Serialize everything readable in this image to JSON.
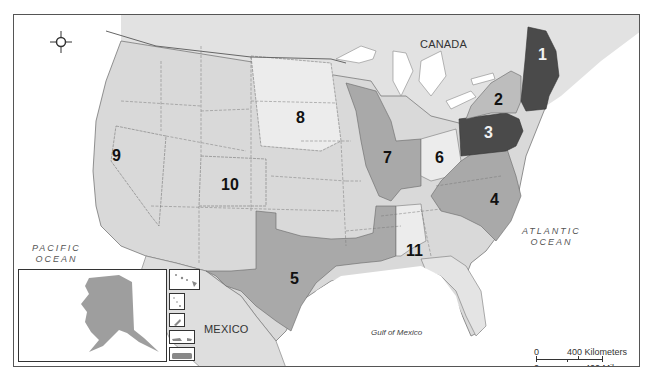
{
  "map": {
    "title": "United States regions map",
    "countries": [
      {
        "name": "CANADA"
      },
      {
        "name": "MEXICO"
      }
    ],
    "water_bodies": [
      {
        "name": "PACIFIC OCEAN",
        "line1": "PACIFIC",
        "line2": "OCEAN"
      },
      {
        "name": "ATLANTIC OCEAN",
        "line1": "ATLANTIC",
        "line2": "OCEAN"
      },
      {
        "name": "Gulf of Mexico"
      }
    ],
    "regions": [
      {
        "id": "1",
        "label": "1",
        "shade": "#4a4a4a",
        "states": "Maine, New Hampshire, Massachusetts"
      },
      {
        "id": "2",
        "label": "2",
        "shade": "#bdbdbd",
        "states": "New York, Vermont, Connecticut, Rhode Island"
      },
      {
        "id": "3",
        "label": "3",
        "shade": "#4a4a4a",
        "states": "Pennsylvania, New Jersey"
      },
      {
        "id": "4",
        "label": "4",
        "shade": "#a9a9a9",
        "states": "Virginia, West Virginia, North Carolina, South Carolina, Maryland, Delaware"
      },
      {
        "id": "5",
        "label": "5",
        "shade": "#a9a9a9",
        "states": "Texas, Louisiana, Mississippi, Oklahoma panhandle area"
      },
      {
        "id": "6",
        "label": "6",
        "shade": "#ececec",
        "states": "Ohio"
      },
      {
        "id": "7",
        "label": "7",
        "shade": "#a9a9a9",
        "states": "Wisconsin, Illinois, Indiana"
      },
      {
        "id": "8",
        "label": "8",
        "shade": "#ececec",
        "states": "North Dakota, South Dakota, Nebraska"
      },
      {
        "id": "9",
        "label": "9",
        "shade": "#d9d9d9",
        "states": "Nevada"
      },
      {
        "id": "10",
        "label": "10",
        "shade": "#d9d9d9",
        "states": "Colorado"
      },
      {
        "id": "11",
        "label": "11",
        "shade": "#ececec",
        "states": "Alabama"
      }
    ],
    "scale_bar": {
      "km_zero": "0",
      "km_label": "400 Kilometers",
      "mi_zero": "0",
      "mi_label": "400 Miles"
    },
    "compass": {
      "n": "N",
      "s": "S",
      "e": "E",
      "w": "W"
    },
    "insets": [
      {
        "name": "Alaska"
      },
      {
        "name": "Hawaii"
      },
      {
        "name": "Northern Mariana Islands"
      },
      {
        "name": "Guam"
      },
      {
        "name": "U.S. Virgin Islands"
      },
      {
        "name": "Puerto Rico"
      }
    ],
    "colors": {
      "land_base": "#d9d9d9",
      "land_light": "#ececec",
      "region_mid": "#a9a9a9",
      "region_dark": "#4a4a4a",
      "water": "#ffffff",
      "border": "#555555"
    }
  }
}
